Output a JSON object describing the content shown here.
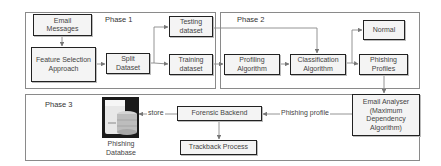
{
  "phases": {
    "phase1": {
      "label": "Phase 1"
    },
    "phase2": {
      "label": "Phase 2"
    },
    "phase3": {
      "label": "Phase 3"
    }
  },
  "nodes": {
    "email_messages": "Email\nMessages",
    "feature_selection": "Feature Selection\nApproach",
    "split_dataset": "Split\nDataset",
    "testing_dataset": "Testing\ndataset",
    "training_dataset": "Training\ndataset",
    "profiling_algorithm": "Profiling\nAlgorithm",
    "classification_algorithm": "Classification\nAlgorithm",
    "normal": "Normal",
    "phishing_profiles": "Phishing\nProfiles",
    "email_analyser": "Email Analyser\n(Maximum\nDependency\nAlgorithm)",
    "forensic_backend": "Forensic Backend",
    "trackback_process": "Trackback Process",
    "phishing_database": "Phishing\nDatabase"
  },
  "edges": {
    "store": "store",
    "phishing_profile": "Phishing profile"
  },
  "icons": {
    "database": "database-server-icon"
  },
  "colors": {
    "box_border": "#222222",
    "phase_border": "#8a8a8a",
    "box_fill": "#f4f4f4",
    "arrow": "#777777"
  }
}
